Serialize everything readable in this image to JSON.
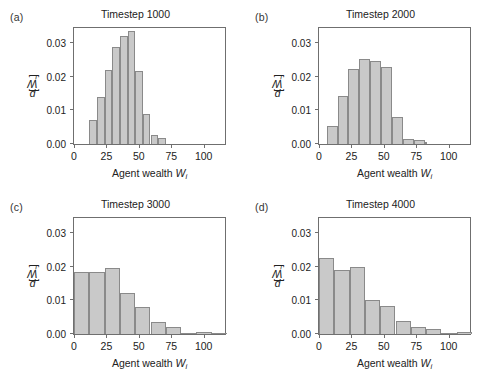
{
  "figure": {
    "axis": {
      "xlabel_prefix": "Agent wealth ",
      "xlabel_symbol": "W",
      "xlabel_subscript": "i",
      "ylabel_prefix": "p[",
      "ylabel_symbol": "W",
      "ylabel_subscript": "i",
      "ylabel_suffix": "]",
      "xticks": [
        0,
        25,
        50,
        75,
        100
      ],
      "xtick_labels": [
        "0",
        "25",
        "50",
        "75",
        "100"
      ],
      "yticks": [
        0.0,
        0.01,
        0.02,
        0.03
      ],
      "ytick_labels": [
        "0.00",
        "0.01",
        "0.02",
        "0.03"
      ],
      "xlim": [
        0,
        118
      ],
      "ylim": [
        0,
        0.035
      ],
      "bar_fill": "#c9c9c9",
      "bar_edge": "#8a8a8a",
      "frame_color": "#6f6f6f"
    },
    "panels": [
      {
        "tag": "(a)",
        "title": "Timestep 1000"
      },
      {
        "tag": "(b)",
        "title": "Timestep 2000"
      },
      {
        "tag": "(c)",
        "title": "Timestep 3000"
      },
      {
        "tag": "(d)",
        "title": "Timestep 4000"
      }
    ]
  },
  "chart_data": [
    {
      "type": "bar",
      "title": "Timestep 1000",
      "panel": "(a)",
      "xlabel": "Agent wealth W_i",
      "ylabel": "p[W_i]",
      "xlim": [
        0,
        118
      ],
      "ylim": [
        0,
        0.035
      ],
      "grid": false,
      "bin_width": 5.9,
      "bin_edges": [
        11.8,
        17.7,
        23.6,
        29.5,
        35.4,
        41.3,
        47.2,
        53.1,
        59.0,
        64.9,
        70.8
      ],
      "values": [
        0.0072,
        0.014,
        0.022,
        0.0288,
        0.032,
        0.0335,
        0.0217,
        0.009,
        0.0028,
        0.0018
      ]
    },
    {
      "type": "bar",
      "title": "Timestep 2000",
      "panel": "(b)",
      "xlabel": "Agent wealth W_i",
      "ylabel": "p[W_i]",
      "xlim": [
        0,
        118
      ],
      "ylim": [
        0,
        0.035
      ],
      "grid": false,
      "bin_width": 8.4,
      "bin_edges": [
        5.9,
        14.3,
        22.7,
        31.1,
        39.5,
        47.9,
        56.3,
        64.7,
        73.1,
        81.5
      ],
      "values": [
        0.0053,
        0.0143,
        0.0222,
        0.0251,
        0.0247,
        0.0229,
        0.0079,
        0.0015,
        0.0013,
        0.0006
      ]
    },
    {
      "type": "bar",
      "title": "Timestep 3000",
      "panel": "(c)",
      "xlabel": "Agent wealth W_i",
      "ylabel": "p[W_i]",
      "xlim": [
        0,
        118
      ],
      "ylim": [
        0,
        0.035
      ],
      "grid": false,
      "bin_width": 11.8,
      "bin_edges": [
        0,
        11.8,
        23.6,
        35.4,
        47.2,
        59.0,
        70.8,
        82.6,
        94.4,
        106.2,
        118.0
      ],
      "values": [
        0.0185,
        0.0185,
        0.0195,
        0.0122,
        0.008,
        0.0035,
        0.002,
        0.0003,
        0.0006,
        0.0002
      ]
    },
    {
      "type": "bar",
      "title": "Timestep 4000",
      "panel": "(d)",
      "xlabel": "Agent wealth W_i",
      "ylabel": "p[W_i]",
      "xlim": [
        0,
        118
      ],
      "ylim": [
        0,
        0.035
      ],
      "grid": false,
      "bin_width": 11.8,
      "bin_edges": [
        0,
        11.8,
        23.6,
        35.4,
        47.2,
        59.0,
        70.8,
        82.6,
        94.4,
        106.2,
        118.0
      ],
      "values": [
        0.0225,
        0.019,
        0.02,
        0.0101,
        0.0083,
        0.004,
        0.0021,
        0.0014,
        0.0004,
        0.0005
      ]
    }
  ]
}
